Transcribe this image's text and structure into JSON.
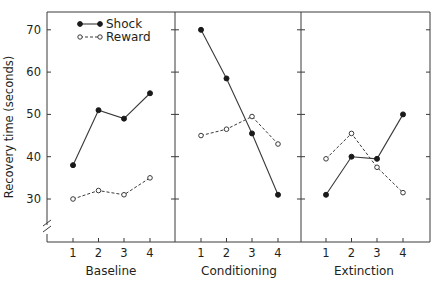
{
  "chart_data": {
    "type": "line",
    "title": "",
    "ylabel": "Recovery time (seconds)",
    "xlabel": "",
    "ylim": [
      22,
      74
    ],
    "y_ticks": [
      30,
      40,
      50,
      60,
      70
    ],
    "y_axis_break": true,
    "grid": false,
    "legend_position": "upper-left (inside first panel)",
    "legend": [
      {
        "name": "Shock",
        "marker": "filled-circle",
        "line": "solid"
      },
      {
        "name": "Reward",
        "marker": "open-circle",
        "line": "dashed"
      }
    ],
    "panels": [
      {
        "label": "Baseline",
        "categories": [
          "1",
          "2",
          "3",
          "4"
        ],
        "series": [
          {
            "name": "Shock",
            "values": [
              38,
              51,
              49,
              55
            ]
          },
          {
            "name": "Reward",
            "values": [
              30,
              32,
              31,
              35
            ]
          }
        ]
      },
      {
        "label": "Conditioning",
        "categories": [
          "1",
          "2",
          "3",
          "4"
        ],
        "series": [
          {
            "name": "Shock",
            "values": [
              70,
              58.5,
              45.5,
              31
            ]
          },
          {
            "name": "Reward",
            "values": [
              45,
              46.5,
              49.5,
              43
            ]
          }
        ]
      },
      {
        "label": "Extinction",
        "categories": [
          "1",
          "2",
          "3",
          "4"
        ],
        "series": [
          {
            "name": "Shock",
            "values": [
              31,
              40,
              39.5,
              50
            ]
          },
          {
            "name": "Reward",
            "values": [
              39.5,
              45.5,
              37.5,
              31.5
            ]
          }
        ]
      }
    ]
  },
  "labels": {
    "ylabel": "Recovery time (seconds)",
    "legend_shock": "Shock",
    "legend_reward": "Reward",
    "y_tick_70": "70",
    "y_tick_60": "60",
    "y_tick_50": "50",
    "y_tick_40": "40",
    "y_tick_30": "30"
  }
}
